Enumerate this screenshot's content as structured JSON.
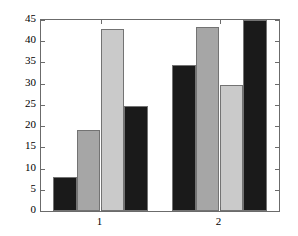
{
  "chart_data": {
    "type": "bar",
    "title": "",
    "subtitle": "",
    "xlabel": "",
    "ylabel": "",
    "categories": [
      "1",
      "2"
    ],
    "series": [
      {
        "name": "series-1",
        "color": "#1a1a1a",
        "values": [
          8,
          34.3
        ]
      },
      {
        "name": "series-2",
        "color": "#a6a6a6",
        "values": [
          19,
          43.3
        ]
      },
      {
        "name": "series-3",
        "color": "#cacaca",
        "values": [
          43,
          29.6
        ]
      },
      {
        "name": "series-4",
        "color": "#1a1a1a",
        "values": [
          24.8,
          45
        ]
      }
    ],
    "ylim": [
      0,
      45
    ],
    "yticks": [
      0,
      5,
      10,
      15,
      20,
      25,
      30,
      35,
      40,
      45
    ],
    "ytick_labels": [
      "0",
      "5",
      "10",
      "15",
      "20",
      "25",
      "30",
      "35",
      "40",
      "45"
    ],
    "xticks": [
      1,
      2
    ],
    "xtick_labels": [
      "1",
      "2"
    ],
    "grid": false,
    "legend": null,
    "legend_position": "none",
    "annotations": [],
    "axis_color": "#6b6b6b",
    "background_color": "#ffffff",
    "bar_edge_color": "#737373",
    "group_count": 2,
    "bars_per_group": 4
  }
}
